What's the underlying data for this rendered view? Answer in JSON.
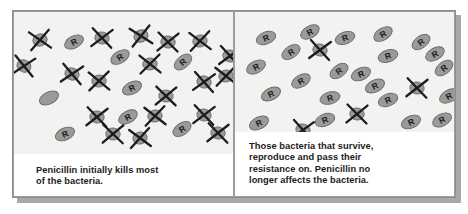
{
  "figure": {
    "background_color": "#ffffff",
    "frame_border_color": "#8e8e90",
    "panel_background_color": "#f2f2f0",
    "caption_background_color": "#ffffff",
    "bacteria_fill_color": "#9a9a9a",
    "bacteria_outline_color": "#6b6b6b",
    "cross_color": "#1c1c1c",
    "text_color": "#1b1b1b"
  },
  "panels": [
    {
      "id": "panel-before",
      "caption": "Penicillin initially kills most\nof the bacteria.",
      "resistant_label": "R",
      "counts": {
        "resistant": 6,
        "killed": 20,
        "plain": 1
      },
      "cells": [
        {
          "x": 26,
          "y": 28,
          "rot": -18,
          "type": "killed"
        },
        {
          "x": 60,
          "y": 30,
          "rot": -28,
          "type": "resistant"
        },
        {
          "x": 88,
          "y": 26,
          "rot": 12,
          "type": "killed"
        },
        {
          "x": 127,
          "y": 24,
          "rot": -24,
          "type": "killed"
        },
        {
          "x": 154,
          "y": 30,
          "rot": 8,
          "type": "killed"
        },
        {
          "x": 186,
          "y": 29,
          "rot": -12,
          "type": "killed"
        },
        {
          "x": 106,
          "y": 45,
          "rot": -32,
          "type": "resistant"
        },
        {
          "x": 216,
          "y": 44,
          "rot": 14,
          "type": "killed"
        },
        {
          "x": 136,
          "y": 52,
          "rot": -8,
          "type": "killed"
        },
        {
          "x": 169,
          "y": 50,
          "rot": -40,
          "type": "resistant"
        },
        {
          "x": 58,
          "y": 62,
          "rot": 20,
          "type": "killed"
        },
        {
          "x": 85,
          "y": 69,
          "rot": -6,
          "type": "killed"
        },
        {
          "x": 190,
          "y": 70,
          "rot": 16,
          "type": "killed"
        },
        {
          "x": 118,
          "y": 76,
          "rot": -26,
          "type": "resistant"
        },
        {
          "x": 35,
          "y": 86,
          "rot": -26,
          "type": "plain"
        },
        {
          "x": 152,
          "y": 84,
          "rot": 6,
          "type": "killed"
        },
        {
          "x": 83,
          "y": 105,
          "rot": 10,
          "type": "killed"
        },
        {
          "x": 114,
          "y": 105,
          "rot": -30,
          "type": "resistant"
        },
        {
          "x": 141,
          "y": 104,
          "rot": -10,
          "type": "killed"
        },
        {
          "x": 190,
          "y": 103,
          "rot": 12,
          "type": "killed"
        },
        {
          "x": 51,
          "y": 122,
          "rot": -24,
          "type": "resistant"
        },
        {
          "x": 99,
          "y": 122,
          "rot": 4,
          "type": "killed"
        },
        {
          "x": 126,
          "y": 126,
          "rot": -14,
          "type": "killed"
        },
        {
          "x": 168,
          "y": 117,
          "rot": -34,
          "type": "resistant"
        },
        {
          "x": 204,
          "y": 121,
          "rot": 10,
          "type": "killed"
        },
        {
          "x": 212,
          "y": 64,
          "rot": -10,
          "type": "killed"
        },
        {
          "x": 10,
          "y": 54,
          "rot": 22,
          "type": "killed"
        }
      ]
    },
    {
      "id": "panel-after",
      "caption": "Those bacteria that survive,\nreproduce and pass their\nresistance on. Penicillin no\nlonger affects the bacteria.",
      "resistant_label": "R",
      "counts": {
        "resistant": 22,
        "killed": 4,
        "plain": 0
      },
      "cells": [
        {
          "x": 31,
          "y": 26,
          "rot": -22,
          "type": "resistant"
        },
        {
          "x": 75,
          "y": 20,
          "rot": -30,
          "type": "resistant"
        },
        {
          "x": 110,
          "y": 26,
          "rot": -20,
          "type": "resistant"
        },
        {
          "x": 148,
          "y": 22,
          "rot": -32,
          "type": "resistant"
        },
        {
          "x": 186,
          "y": 30,
          "rot": -36,
          "type": "resistant"
        },
        {
          "x": 56,
          "y": 40,
          "rot": -34,
          "type": "resistant"
        },
        {
          "x": 85,
          "y": 38,
          "rot": 14,
          "type": "killed"
        },
        {
          "x": 153,
          "y": 44,
          "rot": -18,
          "type": "resistant"
        },
        {
          "x": 21,
          "y": 55,
          "rot": -28,
          "type": "resistant"
        },
        {
          "x": 209,
          "y": 56,
          "rot": -38,
          "type": "resistant"
        },
        {
          "x": 104,
          "y": 59,
          "rot": -36,
          "type": "resistant"
        },
        {
          "x": 126,
          "y": 62,
          "rot": -24,
          "type": "resistant"
        },
        {
          "x": 66,
          "y": 69,
          "rot": -30,
          "type": "resistant"
        },
        {
          "x": 140,
          "y": 74,
          "rot": -26,
          "type": "resistant"
        },
        {
          "x": 182,
          "y": 76,
          "rot": 10,
          "type": "killed"
        },
        {
          "x": 36,
          "y": 82,
          "rot": -26,
          "type": "resistant"
        },
        {
          "x": 95,
          "y": 86,
          "rot": -16,
          "type": "resistant"
        },
        {
          "x": 153,
          "y": 88,
          "rot": -22,
          "type": "resistant"
        },
        {
          "x": 214,
          "y": 84,
          "rot": -30,
          "type": "resistant"
        },
        {
          "x": 122,
          "y": 102,
          "rot": 8,
          "type": "killed"
        },
        {
          "x": 24,
          "y": 111,
          "rot": -26,
          "type": "resistant"
        },
        {
          "x": 68,
          "y": 118,
          "rot": 16,
          "type": "killed"
        },
        {
          "x": 176,
          "y": 110,
          "rot": -24,
          "type": "resistant"
        },
        {
          "x": 207,
          "y": 108,
          "rot": -28,
          "type": "resistant"
        },
        {
          "x": 200,
          "y": 42,
          "rot": -30,
          "type": "resistant"
        },
        {
          "x": 90,
          "y": 108,
          "rot": -22,
          "type": "resistant"
        }
      ]
    }
  ]
}
